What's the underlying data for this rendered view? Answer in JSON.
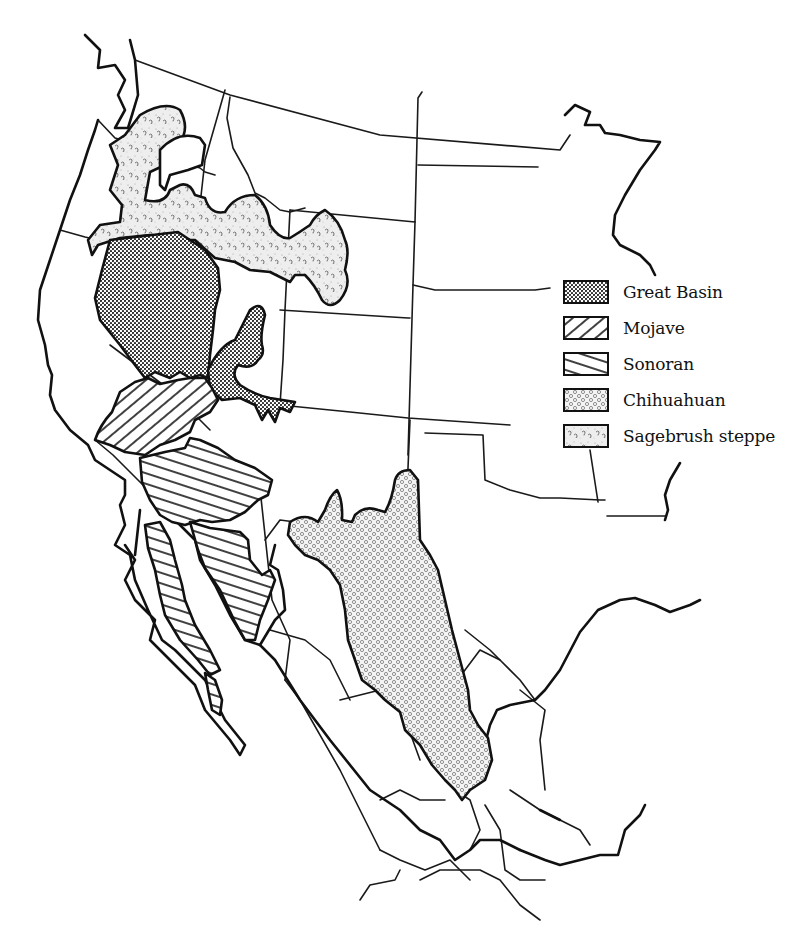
{
  "map": {
    "subject": "Deserts of western North America",
    "colors": {
      "ink": "#111111",
      "background": "#ffffff"
    }
  },
  "legend": {
    "items": [
      {
        "key": "great-basin",
        "label": "Great Basin",
        "pattern": "dense-dots"
      },
      {
        "key": "mojave",
        "label": "Mojave",
        "pattern": "diagonal-forward"
      },
      {
        "key": "sonoran",
        "label": "Sonoran",
        "pattern": "diagonal-backward"
      },
      {
        "key": "chihuahuan",
        "label": "Chihuahuan",
        "pattern": "small-circles"
      },
      {
        "key": "sagebrush-steppe",
        "label": "Sagebrush steppe",
        "pattern": "stipple-marks"
      }
    ]
  }
}
